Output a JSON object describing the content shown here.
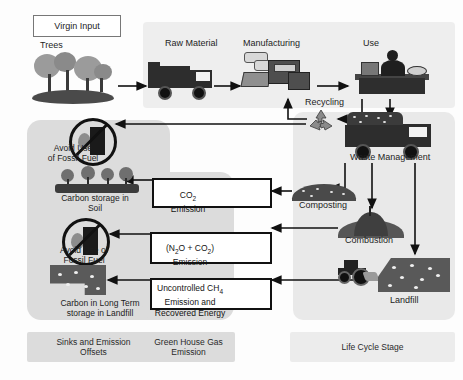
{
  "diagram": {
    "virgin_input_label": "Virgin Input"
  },
  "lifecycle_stages": [
    {
      "id": "trees",
      "label": "Trees"
    },
    {
      "id": "raw-material",
      "label": "Raw Material"
    },
    {
      "id": "manufacturing",
      "label": "Manufacturing"
    },
    {
      "id": "use",
      "label": "Use"
    },
    {
      "id": "recycling",
      "label": "Recycling"
    },
    {
      "id": "waste-management",
      "label": "Waste Management"
    },
    {
      "id": "composting",
      "label": "Composting"
    },
    {
      "id": "combustion",
      "label": "Combustion"
    },
    {
      "id": "landfill",
      "label": "Landfill"
    }
  ],
  "sinks_and_offsets": [
    {
      "id": "avoid-fossil-fuel-1",
      "label": "Avoid Use\nof Fossil Fuel",
      "line1": "Avoid Use",
      "line2": "of Fossil Fuel"
    },
    {
      "id": "carbon-storage-soil",
      "line1": "Carbon storage in",
      "line2": "Soil"
    },
    {
      "id": "avoid-fossil-fuel-2",
      "line1": "Avoid Use of",
      "line2": "Fossil Fuel"
    },
    {
      "id": "carbon-long-term-landfill",
      "line1": "Carbon in Long Term",
      "line2": "storage in Landfill"
    }
  ],
  "ghg_emissions": [
    {
      "id": "co2",
      "line1": "CO",
      "sub1": "2",
      "line2": "Emission"
    },
    {
      "id": "n2o-co2",
      "line1": "(N",
      "sub1": "2",
      "mid1": "O + CO",
      "sub2": "2",
      "end1": ")",
      "line2": "Emission"
    },
    {
      "id": "ch4",
      "line1": "Uncontrolled CH",
      "sub1": "4",
      "line2": "Emission and",
      "line3": "Recovered Energy"
    }
  ],
  "legend": [
    {
      "id": "sinks",
      "line1": "Sinks and Emission",
      "line2": "Offsets"
    },
    {
      "id": "ghg",
      "line1": "Green House Gas",
      "line2": "Emission"
    },
    {
      "id": "lifecycle",
      "line1": "Life Cycle Stage",
      "line2": ""
    }
  ],
  "colors": {
    "panel_sinks": "#dcdcdc",
    "panel_ghg": "#dcdcdc",
    "panel_lifecycle": "#eeeeee",
    "arrow": "#111111",
    "box_border": "#111111"
  }
}
